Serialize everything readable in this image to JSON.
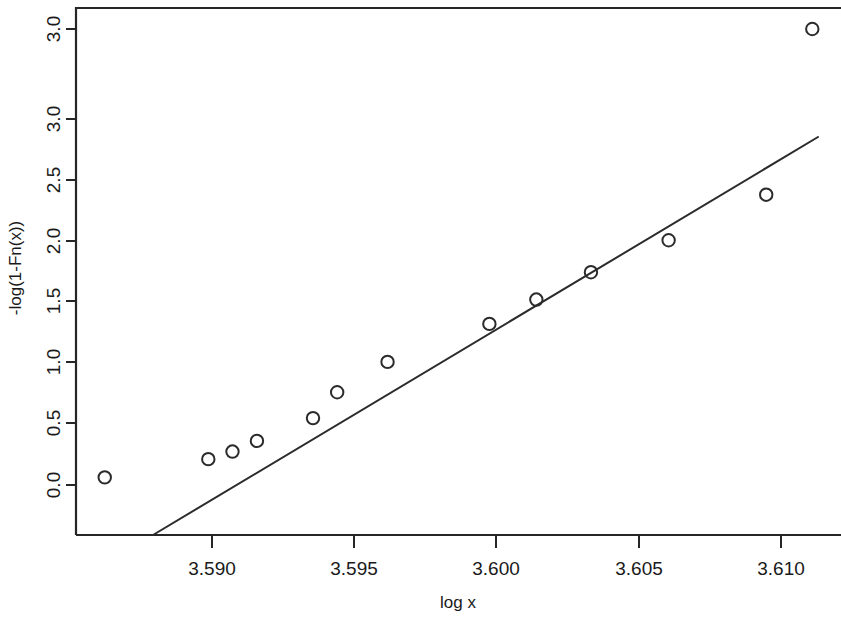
{
  "chart_data": {
    "type": "scatter",
    "title": "",
    "subtitle": "",
    "xlabel": "log x",
    "ylabel": "-log(1-Fn(x))",
    "xlim": [
      3.58535,
      3.6121
    ],
    "ylim": [
      -0.055,
      3.135
    ],
    "grid": false,
    "legend": null,
    "annotations": [],
    "x_ticks": [
      3.59,
      3.595,
      3.6,
      3.605,
      3.61
    ],
    "x_tick_labels": [
      "3.590",
      "3.595",
      "3.600",
      "3.605",
      "3.610"
    ],
    "y_ticks": [
      0.0,
      0.5,
      1.0,
      1.5,
      2.0,
      2.5,
      3.0
    ],
    "y_tick_labels": [
      "0.0",
      "0.5",
      "1.0",
      "1.5",
      "2.0",
      "2.5",
      "3.0"
    ],
    "points": [
      {
        "x": 3.58623,
        "y": 0.05
      },
      {
        "x": 3.58987,
        "y": 0.17
      },
      {
        "x": 3.59072,
        "y": 0.22
      },
      {
        "x": 3.59158,
        "y": 0.29
      },
      {
        "x": 3.59355,
        "y": 0.44
      },
      {
        "x": 3.5944,
        "y": 0.61
      },
      {
        "x": 3.59617,
        "y": 0.81
      },
      {
        "x": 3.59975,
        "y": 1.06
      },
      {
        "x": 3.6014,
        "y": 1.22
      },
      {
        "x": 3.60332,
        "y": 1.4
      },
      {
        "x": 3.60605,
        "y": 1.61
      },
      {
        "x": 3.60948,
        "y": 1.91
      },
      {
        "x": 3.6111,
        "y": 3.0
      }
    ],
    "series": [
      {
        "name": "data",
        "marker": "open-circle",
        "color": "#2b2b2b",
        "x": [
          3.58623,
          3.58987,
          3.59072,
          3.59158,
          3.59355,
          3.5944,
          3.59617,
          3.59975,
          3.6014,
          3.60332,
          3.60605,
          3.60948,
          3.6111
        ],
        "values": [
          0.05,
          0.17,
          0.22,
          0.29,
          0.44,
          0.61,
          0.81,
          1.06,
          1.22,
          1.4,
          1.61,
          1.91,
          3.0
        ]
      },
      {
        "name": "fitted-line",
        "type": "line",
        "color": "#2b2b2b",
        "x": [
          3.58807,
          3.61118
        ],
        "values": [
          0.0,
          2.33
        ]
      }
    ]
  },
  "axes": {
    "x_title": "log x",
    "y_title": "-log(1-Fn(x))"
  }
}
